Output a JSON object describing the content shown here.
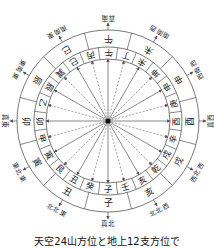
{
  "caption": "天空24山方位と地上12支方位で",
  "center": {
    "x": 108,
    "y": 121
  },
  "radii": {
    "outer": 91,
    "middle": 74,
    "inner": 62,
    "arrow_end": 62,
    "branch_text": 82,
    "mountain_text": 68,
    "label": 103
  },
  "colors": {
    "line": "#555555",
    "text": "#222222",
    "dash": "#777777"
  },
  "twelve_branches": [
    "午",
    "未",
    "申",
    "酉",
    "戌",
    "亥",
    "子",
    "丑",
    "寅",
    "卯",
    "辰",
    "巳"
  ],
  "twenty_four_mountains": [
    "午",
    "丁",
    "未",
    "坤",
    "申",
    "庚",
    "酉",
    "辛",
    "戌",
    "乾",
    "亥",
    "壬",
    "子",
    "癸",
    "丑",
    "艮",
    "寅",
    "甲",
    "卯",
    "乙",
    "辰",
    "巽",
    "巳",
    "丙"
  ],
  "direction_labels": [
    "真南",
    "南南西",
    "西南西",
    "真西",
    "西北西",
    "北北西",
    "真北",
    "北北東",
    "東北東",
    "真東",
    "東南東",
    "南南東"
  ]
}
